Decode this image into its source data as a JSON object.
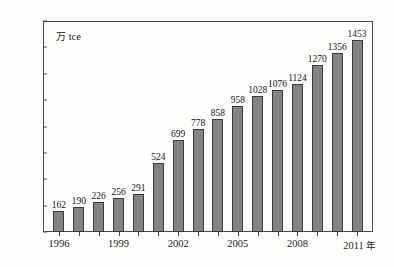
{
  "chart_data": {
    "type": "bar",
    "title": "",
    "subtitle": "",
    "xlabel": "年",
    "ylabel": "",
    "unit_label": "万 tce",
    "unit_label_cjk": "万",
    "unit_label_latin": " tce",
    "categories": [
      "1996",
      "1997",
      "1998",
      "1999",
      "2000",
      "2001",
      "2002",
      "2003",
      "2004",
      "2005",
      "2006",
      "2007",
      "2008",
      "2009",
      "2010",
      "2011"
    ],
    "values": [
      162,
      190,
      226,
      256,
      291,
      524,
      699,
      778,
      858,
      958,
      1028,
      1076,
      1124,
      1270,
      1356,
      1453
    ],
    "data_labels": [
      "162",
      "190",
      "226",
      "256",
      "291",
      "524",
      "699",
      "778",
      "858",
      "958",
      "1028",
      "1076",
      "1124",
      "1270",
      "1356",
      "1453"
    ],
    "ylim": [
      0,
      1600
    ],
    "ytick_values": [
      0,
      200,
      400,
      600,
      800,
      1000,
      1200,
      1400,
      1600
    ],
    "ytick_labels": [
      "0",
      "200",
      "400",
      "600",
      "800",
      "1000",
      "1200",
      "1400",
      "1600"
    ],
    "xtick_labels": [
      "1996",
      "1999",
      "2002",
      "2005",
      "2008",
      "2011"
    ],
    "xtick_label_last_suffix": "年",
    "xtick_indices": [
      0,
      3,
      6,
      9,
      12,
      15
    ],
    "grid": false,
    "legend": false,
    "legend_position": "none",
    "bar_color": "#838383",
    "bar_border_color": "#3b3b3b",
    "axis_color": "#4a4a4a",
    "text_color": "#1d1d1d",
    "background_color": "#fdfdfc"
  }
}
